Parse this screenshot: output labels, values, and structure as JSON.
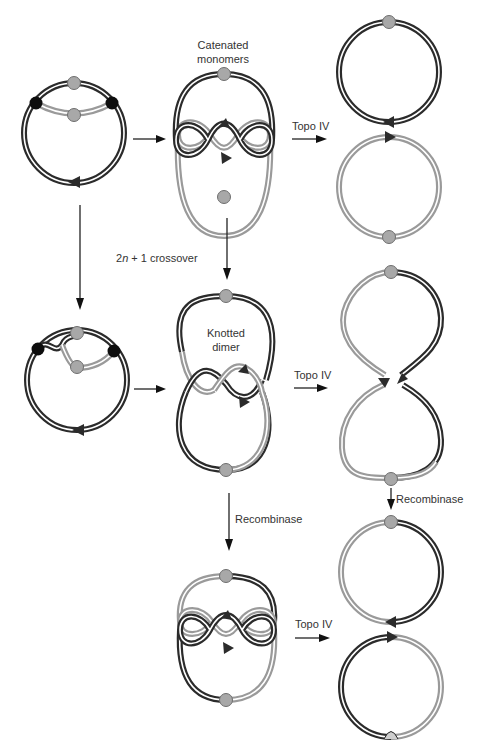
{
  "figure": {
    "labels": {
      "catenated_monomers": [
        "Catenated",
        "monomers"
      ],
      "knotted_dimer": [
        "Knotted",
        "dimer"
      ],
      "crossover": "2n + 1 crossover",
      "topo_iv": "Topo IV",
      "recombinase": "Recombinase"
    },
    "stages": [
      {
        "name": "replicating-circle",
        "sites": [
          "black-site",
          "black-site",
          "gray-site",
          "gray-site"
        ]
      },
      {
        "name": "catenated-monomers"
      },
      {
        "name": "decatenated-monomers"
      },
      {
        "name": "replicating-circle-with-crossover"
      },
      {
        "name": "knotted-dimer"
      },
      {
        "name": "unknotted-dimer"
      },
      {
        "name": "catenated-dimer-after-recombinase"
      },
      {
        "name": "resolved-monomers"
      }
    ],
    "colors": {
      "dark_strand": "#2b2b2b",
      "light_strand": "#9a9a9a",
      "site_gray": "#a8a8a8",
      "site_black": "#0d0d0d",
      "arrow": "#111111"
    }
  }
}
